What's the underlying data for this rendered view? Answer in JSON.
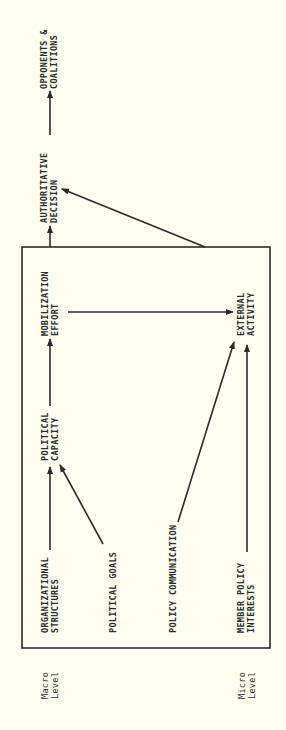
{
  "diagram": {
    "orientation": "rotated-90-ccw",
    "colors": {
      "background": "#fefef0",
      "ink": "#2a2a2a"
    },
    "nodes": {
      "opponents": {
        "line1": "OPPONENTS &",
        "line2": "COALITIONS"
      },
      "authoritative": {
        "line1": "AUTHORITATIVE",
        "line2": "DECISION"
      },
      "mobilization": {
        "line1": "MOBILIZATION",
        "line2": "EFFORT"
      },
      "political_capacity": {
        "line1": "POLITICAL",
        "line2": "CAPACITY"
      },
      "organizational": {
        "line1": "ORGANIZATIONAL",
        "line2": "STRUCTURES"
      },
      "political_goals": {
        "line1": "POLITICAL GOALS"
      },
      "external_activity": {
        "line1": "EXTERNAL",
        "line2": "ACTIVITY"
      },
      "policy_communication": {
        "line1": "POLICY COMMUNICATION"
      },
      "member_policy": {
        "line1": "MEMBER POLICY",
        "line2": "INTERESTS"
      }
    },
    "levels": {
      "macro": {
        "line1": "Macro",
        "line2": "Level"
      },
      "micro": {
        "line1": "Micro",
        "line2": "Level"
      }
    },
    "edges": [
      {
        "from": "organizational",
        "to": "political_capacity"
      },
      {
        "from": "political_goals",
        "to": "political_capacity"
      },
      {
        "from": "political_capacity",
        "to": "mobilization"
      },
      {
        "from": "mobilization",
        "to": "external_activity"
      },
      {
        "from": "policy_communication",
        "to": "external_activity"
      },
      {
        "from": "member_policy",
        "to": "external_activity"
      },
      {
        "from": "box",
        "to": "authoritative"
      },
      {
        "from": "box",
        "to": "authoritative",
        "style": "diagonal"
      },
      {
        "from": "authoritative",
        "to": "opponents"
      }
    ]
  }
}
